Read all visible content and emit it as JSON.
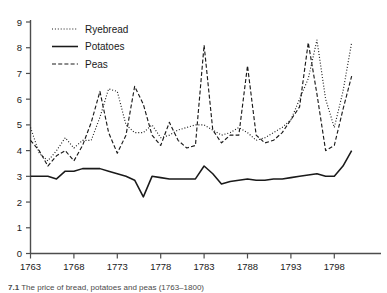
{
  "chart_data": {
    "type": "line",
    "title": "",
    "xlabel": "",
    "ylabel": "",
    "xlim": [
      1763,
      1800
    ],
    "ylim": [
      0,
      9
    ],
    "yticks": [
      0,
      1,
      2,
      3,
      4,
      5,
      6,
      7,
      8,
      9
    ],
    "xticks": [
      1763,
      1768,
      1773,
      1778,
      1783,
      1788,
      1793,
      1798
    ],
    "grid": false,
    "legend_position": "top-left",
    "x": [
      1763,
      1764,
      1765,
      1766,
      1767,
      1768,
      1769,
      1770,
      1771,
      1772,
      1773,
      1774,
      1775,
      1776,
      1777,
      1778,
      1779,
      1780,
      1781,
      1782,
      1783,
      1784,
      1785,
      1786,
      1787,
      1788,
      1789,
      1790,
      1791,
      1792,
      1793,
      1794,
      1795,
      1796,
      1797,
      1798,
      1799,
      1800
    ],
    "series": [
      {
        "name": "Ryebread",
        "style": "dotted",
        "values": [
          4.9,
          3.9,
          3.6,
          4.0,
          4.5,
          4.1,
          4.4,
          4.4,
          5.3,
          6.4,
          6.3,
          5.0,
          4.7,
          4.7,
          5.0,
          4.5,
          4.6,
          4.8,
          4.9,
          5.0,
          5.0,
          4.8,
          4.6,
          4.7,
          4.9,
          4.7,
          4.4,
          4.5,
          4.7,
          4.9,
          5.2,
          6.0,
          6.8,
          8.3,
          6.0,
          4.9,
          6.3,
          8.2
        ]
      },
      {
        "name": "Potatoes",
        "style": "solid",
        "values": [
          3.0,
          3.0,
          3.0,
          2.9,
          3.2,
          3.2,
          3.3,
          3.3,
          3.3,
          3.2,
          3.1,
          3.0,
          2.85,
          2.2,
          3.0,
          2.95,
          2.9,
          2.9,
          2.9,
          2.9,
          3.4,
          3.1,
          2.7,
          2.8,
          2.85,
          2.9,
          2.85,
          2.85,
          2.9,
          2.9,
          2.95,
          3.0,
          3.05,
          3.1,
          3.0,
          3.0,
          3.4,
          4.0
        ]
      },
      {
        "name": "Peas",
        "style": "dashed",
        "values": [
          4.4,
          4.0,
          3.4,
          3.8,
          4.0,
          3.6,
          4.2,
          5.1,
          6.3,
          4.7,
          3.9,
          4.6,
          6.5,
          5.8,
          4.6,
          4.2,
          5.1,
          4.4,
          4.1,
          4.2,
          8.1,
          4.8,
          4.3,
          4.6,
          4.6,
          7.3,
          4.6,
          4.3,
          4.4,
          4.7,
          5.2,
          5.7,
          8.2,
          6.2,
          4.0,
          4.2,
          5.6,
          6.9
        ]
      }
    ]
  },
  "legend": {
    "items": [
      {
        "label": "Ryebread",
        "style": "dotted"
      },
      {
        "label": "Potatoes",
        "style": "solid"
      },
      {
        "label": "Peas",
        "style": "dashed"
      }
    ]
  },
  "caption": {
    "figure_number": "7.1",
    "text": "The price of bread, potatoes and peas (1763–1800)"
  }
}
